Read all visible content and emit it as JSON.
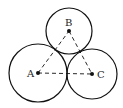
{
  "diagram": {
    "points": [
      {
        "label": "A",
        "x": 38,
        "y": 73
      },
      {
        "label": "B",
        "x": 69,
        "y": 31
      },
      {
        "label": "C",
        "x": 92,
        "y": 74
      }
    ],
    "circles": [
      {
        "center": "A",
        "r": 29
      },
      {
        "center": "B",
        "r": 23
      },
      {
        "center": "C",
        "r": 25
      }
    ],
    "segments": [
      {
        "from": "A",
        "to": "B",
        "style": "dashed"
      },
      {
        "from": "B",
        "to": "C",
        "style": "dashed"
      },
      {
        "from": "A",
        "to": "C",
        "style": "dashed"
      }
    ],
    "colors": {
      "stroke": "#111111",
      "background": "#ffffff"
    }
  }
}
